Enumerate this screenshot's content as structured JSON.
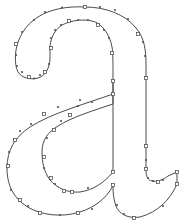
{
  "figure": {
    "glyph": "a",
    "colors": {
      "background": "#ffffff",
      "outline": "#4a4a4a",
      "nodes": "#555555"
    },
    "contours": [
      {
        "name": "outer-contour",
        "path": "M113,81 L113,94 C100,98 60,110 45,122 C30,134 20,150 20,170 C20,195 35,208 55,213 C75,218 100,212 113,198 L113,184 C108,200 95,210 75,212 C55,213 42,205 42,187 C42,170 52,160 65,150 C80,140 105,134 113,132 Z"
      }
    ]
  }
}
